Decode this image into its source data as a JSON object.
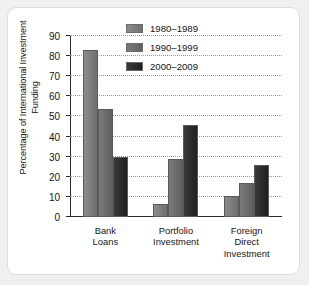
{
  "chart_data": {
    "type": "bar",
    "title": "",
    "xlabel": "",
    "ylabel": "Percentage of International Investment Funding",
    "ylim": [
      0,
      90
    ],
    "ytick_step": 10,
    "yticks": [
      "90",
      "80",
      "70",
      "60",
      "50",
      "40",
      "30",
      "20",
      "10",
      "0"
    ],
    "grid": true,
    "legend_position": "top-right",
    "categories": [
      "Bank Loans",
      "Portfolio Investment",
      "Foreign Direct Investment"
    ],
    "category_lines": [
      [
        "Bank",
        "Loans"
      ],
      [
        "Portfolio",
        "Investment"
      ],
      [
        "Foreign",
        "Direct",
        "Investment"
      ]
    ],
    "series": [
      {
        "name": "1980–1989",
        "color": "#7f7f7f",
        "values": [
          83,
          6.5,
          10.5
        ]
      },
      {
        "name": "1990–1999",
        "color": "#6e6e6e",
        "values": [
          53.5,
          29,
          17
        ]
      },
      {
        "name": "2000–2009",
        "color": "#2a2a2a",
        "values": [
          30,
          46,
          26
        ]
      }
    ]
  },
  "legend": {
    "items": [
      {
        "label": "1980–1989"
      },
      {
        "label": "1990–1999"
      },
      {
        "label": "2000–2009"
      }
    ]
  },
  "colors": {
    "background": "#f0f0ef",
    "card": "#ffffff",
    "axis": "#2b2b2b",
    "grid": "#9a9a9a",
    "text": "#161616"
  }
}
